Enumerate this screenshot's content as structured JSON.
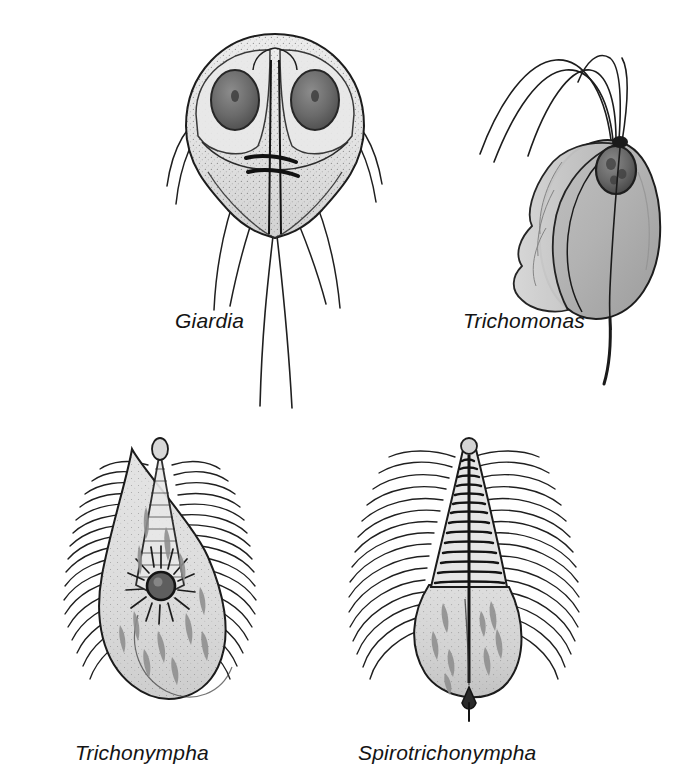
{
  "figure": {
    "background_color": "#ffffff",
    "width": 691,
    "height": 783,
    "kind": "scientific-illustration"
  },
  "palette": {
    "ink": "#1a1a1a",
    "outline": "#222222",
    "cytoplasm_light": "#e8e8e8",
    "cytoplasm_mid": "#cfcfcf",
    "body_gray": "#b4b4b4",
    "body_gray_dark": "#9a9a9a",
    "nucleus_fill": "#6c6c6c",
    "nucleus_dark": "#4a4a4a",
    "inclusion": "#8e8e8e",
    "stipple": "#555555",
    "background": "#ffffff"
  },
  "organisms": [
    {
      "id": "giardia",
      "label": "Giardia",
      "label_x": 175,
      "label_y": 325,
      "position": {
        "x": 150,
        "y": 18
      },
      "features": [
        "teardrop-shaped body",
        "two oval nuclei",
        "adhesive disc",
        "median bodies",
        "eight flagella",
        "long caudal flagella"
      ]
    },
    {
      "id": "trichomonas",
      "label": "Trichomonas",
      "label_x": 463,
      "label_y": 325,
      "position": {
        "x": 470,
        "y": 22
      },
      "features": [
        "ovoid body",
        "undulating membrane",
        "single anterior nucleus",
        "tuft of anterior flagella",
        "posterior axostyle"
      ]
    },
    {
      "id": "trichonympha",
      "label": "Trichonympha",
      "label_x": 75,
      "label_y": 757,
      "position": {
        "x": 60,
        "y": 435
      },
      "features": [
        "pear-shaped body",
        "conical rostrum",
        "dense flagella rows",
        "radiating nucleus",
        "cytoplasmic inclusions"
      ]
    },
    {
      "id": "spirotrichonympha",
      "label": "Spirotrichonympha",
      "label_x": 358,
      "label_y": 757,
      "position": {
        "x": 345,
        "y": 435
      },
      "features": [
        "spiral flagellar bands",
        "conical anterior",
        "rounded posterior body",
        "pointed tail",
        "central axostyle",
        "cytoplasmic inclusions"
      ]
    }
  ]
}
